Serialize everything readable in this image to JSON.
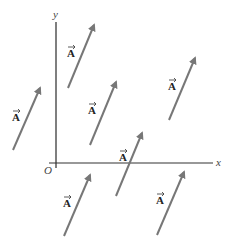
{
  "diagram": {
    "axes": {
      "x_label": "x",
      "y_label": "y",
      "origin_label": "O",
      "color": "#333333"
    },
    "vector_label": "A",
    "vector_color": "#777777",
    "vectors": [
      {
        "x1": 68,
        "y1": 88,
        "x2": 94,
        "y2": 25,
        "lx": 67,
        "ly": 57,
        "label": "A"
      },
      {
        "x1": 13,
        "y1": 150,
        "x2": 40,
        "y2": 88,
        "lx": 12,
        "ly": 121,
        "label": "A"
      },
      {
        "x1": 90,
        "y1": 145,
        "x2": 116,
        "y2": 82,
        "lx": 88,
        "ly": 114,
        "label": "A"
      },
      {
        "x1": 169,
        "y1": 120,
        "x2": 195,
        "y2": 58,
        "lx": 168,
        "ly": 90,
        "label": "A"
      },
      {
        "x1": 116,
        "y1": 196,
        "x2": 142,
        "y2": 133,
        "lx": 119,
        "ly": 161,
        "label": "A"
      },
      {
        "x1": 64,
        "y1": 236,
        "x2": 90,
        "y2": 175,
        "lx": 63,
        "ly": 207,
        "label": "A"
      },
      {
        "x1": 157,
        "y1": 235,
        "x2": 184,
        "y2": 172,
        "lx": 156,
        "ly": 204,
        "label": "A"
      }
    ]
  }
}
